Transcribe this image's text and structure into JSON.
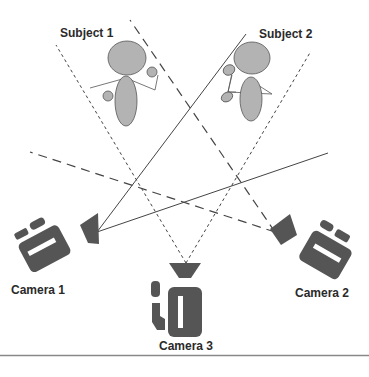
{
  "diagram": {
    "type": "multi-camera-setup",
    "subjects": [
      {
        "label": "Subject 1"
      },
      {
        "label": "Subject 2"
      }
    ],
    "cameras": [
      {
        "label": "Camera 1",
        "line_style": "solid"
      },
      {
        "label": "Camera 2",
        "line_style": "dashed"
      },
      {
        "label": "Camera 3",
        "line_style": "dotted"
      }
    ],
    "colors": {
      "camera_fill": "#555555",
      "subject_fill": "#b3b3b3",
      "subject_stroke": "#555555",
      "line_color": "#444444",
      "separator": "#888888"
    }
  }
}
